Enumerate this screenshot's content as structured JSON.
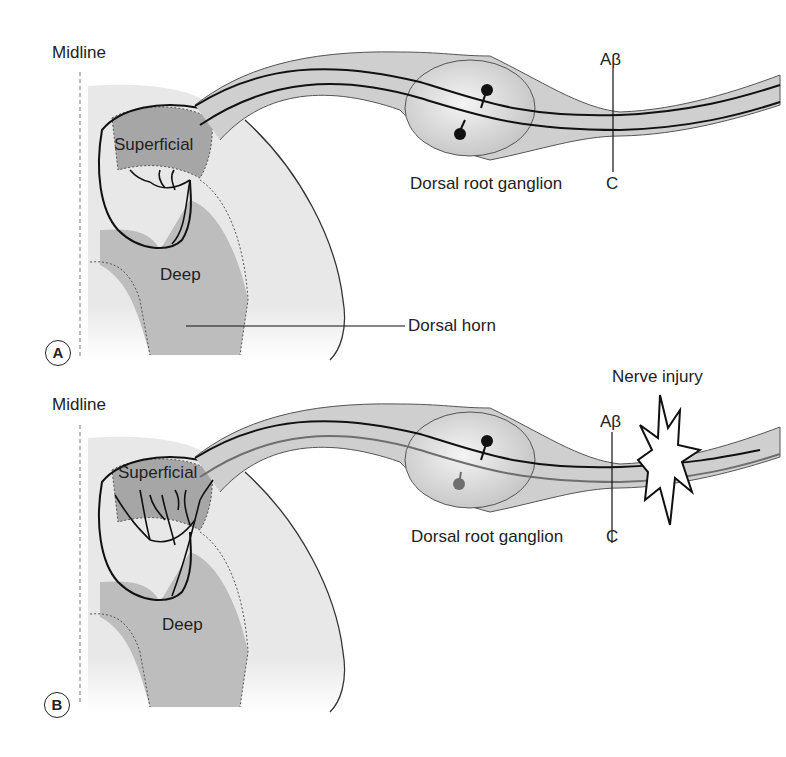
{
  "panels": [
    {
      "id": "A",
      "badge": "A",
      "midline_label": "Midline",
      "superficial_label": "Superficial",
      "deep_label": "Deep",
      "drg_label": "Dorsal root ganglion",
      "abeta_label": "Aβ",
      "c_label": "C",
      "dorsal_horn_label": "Dorsal horn"
    },
    {
      "id": "B",
      "badge": "B",
      "midline_label": "Midline",
      "superficial_label": "Superficial",
      "deep_label": "Deep",
      "drg_label": "Dorsal root ganglion",
      "abeta_label": "Aβ",
      "c_label": "C",
      "injury_label": "Nerve injury"
    }
  ],
  "colors": {
    "cord_light": "#e6e6e6",
    "grey_matter": "#b8b8b8",
    "superficial": "#a9a9a9",
    "nerve_fill": "#cfcfcf",
    "line": "#1a1a1a",
    "c_fiber_injured": "#6e6e6e"
  }
}
